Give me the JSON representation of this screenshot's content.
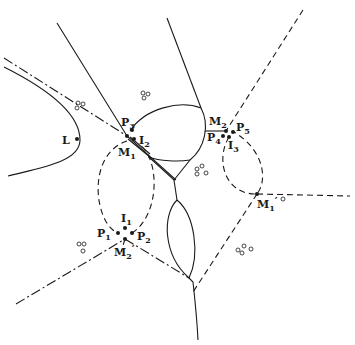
{
  "figure": {
    "colors": {
      "ink": "#1a1a1a",
      "background": "#ffffff"
    }
  },
  "labels": {
    "L": {
      "main": "L",
      "sub": ""
    },
    "P3": {
      "main": "P",
      "sub": "3"
    },
    "I2": {
      "main": "I",
      "sub": "2"
    },
    "M1": {
      "main": "M",
      "sub": "1"
    },
    "M2_top": {
      "main": "M",
      "sub": "2"
    },
    "P5": {
      "main": "P",
      "sub": "5"
    },
    "P4": {
      "main": "P",
      "sub": "4"
    },
    "I3": {
      "main": "I",
      "sub": "3"
    },
    "M1_prime": {
      "main": "M",
      "sub": "1",
      "prime": "′"
    },
    "I1": {
      "main": "I",
      "sub": "1"
    },
    "P1": {
      "main": "P",
      "sub": "1"
    },
    "P2": {
      "main": "P",
      "sub": "2"
    },
    "M2_bottom": {
      "main": "M",
      "sub": "2",
      "prime": "′"
    }
  },
  "points": [
    {
      "id": "L",
      "x": 77,
      "y": 139
    },
    {
      "id": "P3",
      "x": 132,
      "y": 129
    },
    {
      "id": "M1",
      "x": 127,
      "y": 136
    },
    {
      "id": "I2",
      "x": 134,
      "y": 139
    },
    {
      "id": "M2_top",
      "x": 226,
      "y": 131
    },
    {
      "id": "P5",
      "x": 233,
      "y": 132
    },
    {
      "id": "P4",
      "x": 223,
      "y": 136
    },
    {
      "id": "I3",
      "x": 229,
      "y": 137
    },
    {
      "id": "M1_prime",
      "x": 257,
      "y": 194
    },
    {
      "id": "I1",
      "x": 125,
      "y": 228
    },
    {
      "id": "P1",
      "x": 118,
      "y": 233
    },
    {
      "id": "P2",
      "x": 132,
      "y": 233
    },
    {
      "id": "M2_bottom",
      "x": 125,
      "y": 239
    }
  ],
  "circle_clusters": [
    {
      "x": 78,
      "y": 105
    },
    {
      "x": 145,
      "y": 94
    },
    {
      "x": 203,
      "y": 172
    },
    {
      "x": 83,
      "y": 243
    },
    {
      "x": 244,
      "y": 249
    },
    {
      "x": 283,
      "y": 199
    }
  ]
}
